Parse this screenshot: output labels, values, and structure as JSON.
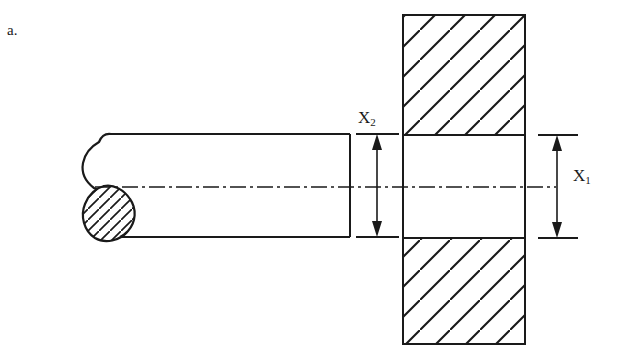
{
  "figure": {
    "label": "a.",
    "type": "engineering-section-drawing",
    "background_color": "#ffffff",
    "line_color": "#1a1a1a"
  },
  "dimensions": [
    {
      "id": "x2",
      "base": "X",
      "subscript": "2",
      "label": "X2",
      "orientation": "vertical",
      "arrow": "double-headed",
      "measures": "shaft diameter",
      "label_x": 358,
      "label_y": 108,
      "arrow_x": 377,
      "from_y": 134,
      "to_y": 237
    },
    {
      "id": "x1",
      "base": "X",
      "subscript": "1",
      "label": "X1",
      "orientation": "vertical",
      "arrow": "double-headed",
      "measures": "plate bore height",
      "label_x": 573,
      "label_y": 166,
      "arrow_x": 557,
      "from_y": 135,
      "to_y": 238
    }
  ],
  "parts": [
    {
      "name": "shaft",
      "kind": "shaft-body",
      "left": 120,
      "right": 350,
      "top": 134,
      "bottom": 237,
      "end_profile": "hook-curve-with-sectioned-bulb",
      "hatched": false
    },
    {
      "name": "shaft-end-bulb",
      "kind": "sectioned-region",
      "hatched": true,
      "hatch_angle_deg": 45,
      "position": "below-centerline-left-end"
    },
    {
      "name": "plate",
      "kind": "sectioned-plate",
      "left": 403,
      "right": 525,
      "top": 15,
      "bottom": 344,
      "hatched": true,
      "hatch_angle_deg": 45,
      "hatch_spacing_px": 30
    },
    {
      "name": "plate-bore",
      "kind": "through-hole",
      "left": 403,
      "right": 525,
      "top": 135,
      "bottom": 238,
      "hatched": false
    }
  ],
  "centerline": {
    "name": "axis-centerline",
    "style": "dash-dot",
    "y": 187,
    "from_x": 95,
    "to_x": 556
  }
}
